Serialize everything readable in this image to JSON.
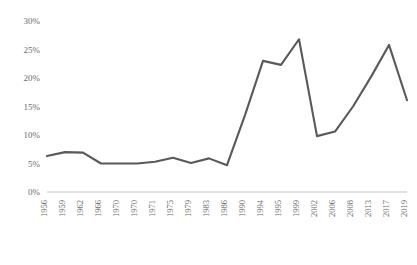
{
  "chart_data": {
    "type": "line",
    "title": "",
    "subtitle": "",
    "xlabel": "",
    "ylabel": "",
    "grid": false,
    "legend": false,
    "legend_position": "none",
    "line_color": "#595959",
    "axis_color": "#bfbfbf",
    "tick_label_color": "#6b6b6b",
    "ylim": [
      0,
      30
    ],
    "ytick_values": [
      0,
      5,
      10,
      15,
      20,
      25,
      30
    ],
    "ytick_labels": [
      "0%",
      "5%",
      "10%",
      "15%",
      "20%",
      "25%",
      "30%"
    ],
    "categories": [
      "1956",
      "1959",
      "1962",
      "1966",
      "1970",
      "1970",
      "1971",
      "1975",
      "1979",
      "1983",
      "1986",
      "1990",
      "1994",
      "1995",
      "1999",
      "2002",
      "2006",
      "2008",
      "2013",
      "2017",
      "2019"
    ],
    "xtick_labels": [
      "1956",
      "1959",
      "1962",
      "1966",
      "1970",
      "1970",
      "1971",
      "1975",
      "1979",
      "1983",
      "1986",
      "1990",
      "1994",
      "1995",
      "1999",
      "2002",
      "2006",
      "2008",
      "2013",
      "2017",
      "2019"
    ],
    "xtick_rotation": 90,
    "series": [
      {
        "name": "series-1",
        "values": [
          6.3,
          7.0,
          6.9,
          5.0,
          5.0,
          5.0,
          5.3,
          6.0,
          5.1,
          5.9,
          4.7,
          13.5,
          23.0,
          22.3,
          26.8,
          9.8,
          10.6,
          15.0,
          20.2,
          25.8,
          16.1
        ]
      }
    ]
  }
}
